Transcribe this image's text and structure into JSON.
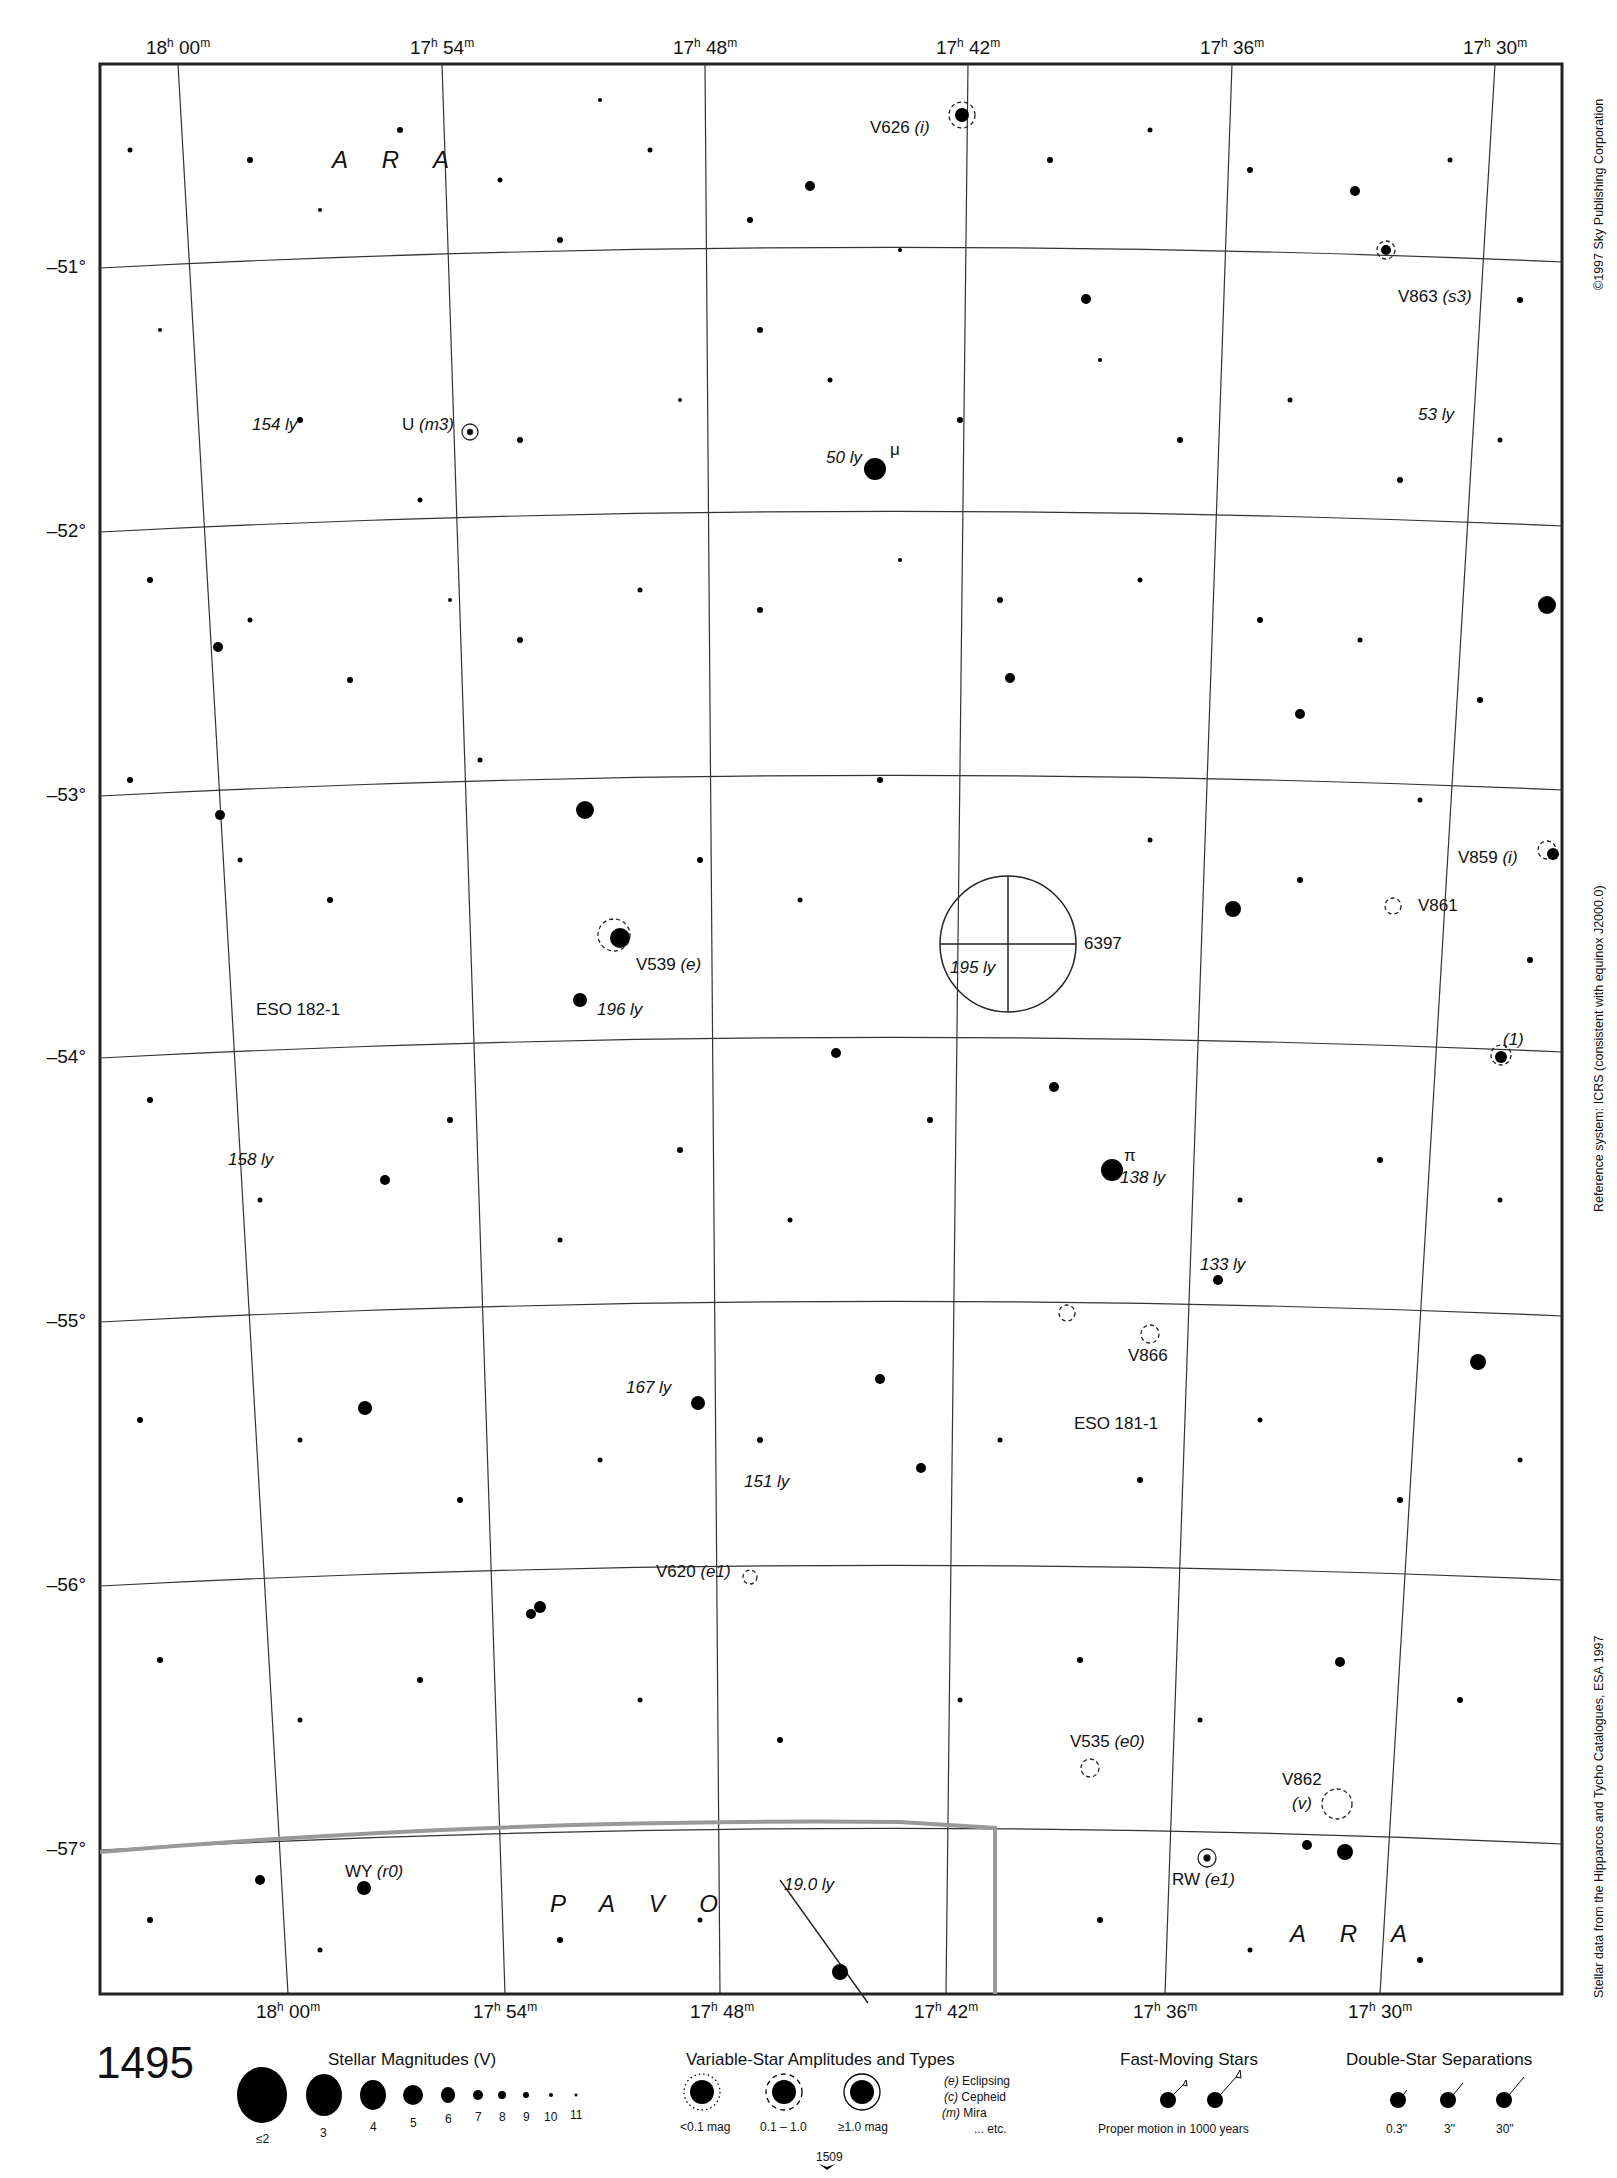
{
  "header": {
    "page_running_title": "MILLENNIUM STAR ATLAS"
  },
  "axes": {
    "ra_top": [
      {
        "h": "18",
        "m": "00"
      },
      {
        "h": "17",
        "m": "54"
      },
      {
        "h": "17",
        "m": "48"
      },
      {
        "h": "17",
        "m": "42"
      },
      {
        "h": "17",
        "m": "36"
      },
      {
        "h": "17",
        "m": "30"
      }
    ],
    "ra_bottom": [
      {
        "h": "18",
        "m": "00"
      },
      {
        "h": "17",
        "m": "54"
      },
      {
        "h": "17",
        "m": "48"
      },
      {
        "h": "17",
        "m": "42"
      },
      {
        "h": "17",
        "m": "36"
      },
      {
        "h": "17",
        "m": "30"
      }
    ],
    "dec": [
      "–51°",
      "–52°",
      "–53°",
      "–54°",
      "–55°",
      "–56°",
      "–57°"
    ]
  },
  "constellations": [
    "A R A",
    "P A V O",
    "A R A"
  ],
  "labels": {
    "v626": "V626",
    "v626_type": "(i)",
    "v863": "V863",
    "v863_type": "(s3)",
    "ly154": "154 ly",
    "u_star": "U",
    "u_type": "(m3)",
    "ly50": "50 ly",
    "mu": "μ",
    "ly53": "53 ly",
    "v859": "V859",
    "v859_type": "(i)",
    "v861": "V861",
    "cluster": "6397",
    "ly195": "195 ly",
    "v539": "V539",
    "v539_type": "(e)",
    "eso1821": "ESO 182-1",
    "ly196": "196 ly",
    "one": "(1)",
    "ly158": "158 ly",
    "pi": "π",
    "ly138": "138 ly",
    "ly133": "133 ly",
    "v866": "V866",
    "ly167": "167 ly",
    "eso1811": "ESO 181-1",
    "ly151": "151 ly",
    "v620": "V620",
    "v620_type": "(e1)",
    "v535": "V535",
    "v535_type": "(e0)",
    "v862": "V862",
    "v862_type": "(v)",
    "wy": "WY",
    "wy_type": "(r0)",
    "rw": "RW",
    "rw_type": "(e1)",
    "ly19": "19.0 ly"
  },
  "side_text": {
    "copyright": "©1997 Sky Publishing Corporation",
    "reference": "Reference system: ICRS (consistent with equinox J2000.0)",
    "source": "Stellar data from the Hipparcos and Tycho Catalogues, ESA 1997"
  },
  "legend": {
    "page_number": "1495",
    "magnitudes": {
      "title": "Stellar Magnitudes (V)",
      "items": [
        "≤2",
        "3",
        "4",
        "5",
        "6",
        "7",
        "8",
        "9",
        "10",
        "11"
      ]
    },
    "variables": {
      "title": "Variable-Star Amplitudes and Types",
      "amplitudes": [
        "<0.1 mag",
        "0.1 – 1.0",
        "≥1.0 mag"
      ],
      "types": [
        {
          "code": "(e)",
          "name": "Eclipsing"
        },
        {
          "code": "(c)",
          "name": "Cepheid"
        },
        {
          "code": "(m)",
          "name": "Mira"
        },
        {
          "code": "",
          "name": "... etc."
        }
      ]
    },
    "fast_moving": {
      "title": "Fast-Moving Stars",
      "caption": "Proper motion in 1000 years"
    },
    "double_stars": {
      "title": "Double-Star Separations",
      "items": [
        "0.3\"",
        "3\"",
        "30\""
      ]
    },
    "next_page": "1509"
  }
}
